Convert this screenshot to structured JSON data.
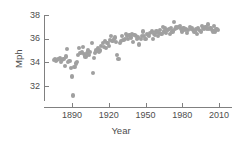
{
  "chart_data": {
    "type": "scatter",
    "title": "",
    "xlabel": "Year",
    "ylabel": "Mph",
    "xlim": [
      1872,
      2014
    ],
    "ylim": [
      30.9,
      38.4
    ],
    "grid": false,
    "legend": "none",
    "marker_color": "#a0a0a0",
    "axis_color": "#808080",
    "text_color": "#4d4d4d",
    "xticks": [
      1890,
      1920,
      1950,
      1980,
      2010
    ],
    "xtick_labels": [
      "1890",
      "1920",
      "1950",
      "1980",
      "2010"
    ],
    "yticks": [
      32,
      34,
      36,
      38
    ],
    "ytick_labels": [
      "32",
      "34",
      "36",
      "38"
    ],
    "points": [
      [
        1875,
        34.2
      ],
      [
        1876,
        34.3
      ],
      [
        1877,
        34.1
      ],
      [
        1878,
        34.2
      ],
      [
        1879,
        34.3
      ],
      [
        1880,
        34.4
      ],
      [
        1881,
        34.0
      ],
      [
        1882,
        34.2
      ],
      [
        1883,
        34.3
      ],
      [
        1884,
        33.7
      ],
      [
        1885,
        34.5
      ],
      [
        1886,
        35.1
      ],
      [
        1887,
        34.0
      ],
      [
        1888,
        34.1
      ],
      [
        1889,
        33.5
      ],
      [
        1890,
        32.8
      ],
      [
        1891,
        31.2
      ],
      [
        1892,
        33.6
      ],
      [
        1893,
        33.9
      ],
      [
        1894,
        34.0
      ],
      [
        1895,
        34.6
      ],
      [
        1896,
        35.2
      ],
      [
        1897,
        34.8
      ],
      [
        1898,
        34.9
      ],
      [
        1899,
        35.3
      ],
      [
        1900,
        34.7
      ],
      [
        1901,
        34.5
      ],
      [
        1902,
        34.8
      ],
      [
        1903,
        35.0
      ],
      [
        1904,
        34.6
      ],
      [
        1905,
        34.9
      ],
      [
        1906,
        35.6
      ],
      [
        1907,
        33.1
      ],
      [
        1908,
        34.4
      ],
      [
        1909,
        34.8
      ],
      [
        1910,
        35.0
      ],
      [
        1911,
        35.2
      ],
      [
        1912,
        34.9
      ],
      [
        1913,
        35.0
      ],
      [
        1914,
        35.4
      ],
      [
        1915,
        35.6
      ],
      [
        1916,
        35.3
      ],
      [
        1917,
        35.8
      ],
      [
        1918,
        35.2
      ],
      [
        1919,
        35.6
      ],
      [
        1920,
        35.4
      ],
      [
        1921,
        35.9
      ],
      [
        1922,
        36.2
      ],
      [
        1923,
        35.8
      ],
      [
        1924,
        36.0
      ],
      [
        1925,
        36.1
      ],
      [
        1926,
        35.7
      ],
      [
        1927,
        34.6
      ],
      [
        1928,
        34.3
      ],
      [
        1929,
        35.6
      ],
      [
        1930,
        35.8
      ],
      [
        1931,
        36.2
      ],
      [
        1932,
        35.9
      ],
      [
        1933,
        36.0
      ],
      [
        1934,
        36.4
      ],
      [
        1935,
        36.2
      ],
      [
        1936,
        36.0
      ],
      [
        1937,
        36.3
      ],
      [
        1938,
        36.1
      ],
      [
        1939,
        36.4
      ],
      [
        1940,
        35.7
      ],
      [
        1941,
        36.3
      ],
      [
        1942,
        36.2
      ],
      [
        1943,
        36.0
      ],
      [
        1944,
        36.1
      ],
      [
        1945,
        35.5
      ],
      [
        1946,
        36.0
      ],
      [
        1947,
        36.2
      ],
      [
        1948,
        36.6
      ],
      [
        1949,
        36.2
      ],
      [
        1950,
        36.0
      ],
      [
        1951,
        36.4
      ],
      [
        1952,
        36.3
      ],
      [
        1953,
        36.2
      ],
      [
        1954,
        36.5
      ],
      [
        1955,
        36.6
      ],
      [
        1956,
        36.0
      ],
      [
        1957,
        36.4
      ],
      [
        1958,
        36.3
      ],
      [
        1959,
        36.6
      ],
      [
        1960,
        36.2
      ],
      [
        1961,
        36.5
      ],
      [
        1962,
        36.7
      ],
      [
        1963,
        36.4
      ],
      [
        1964,
        37.0
      ],
      [
        1965,
        36.6
      ],
      [
        1966,
        36.9
      ],
      [
        1967,
        36.5
      ],
      [
        1968,
        36.7
      ],
      [
        1969,
        36.8
      ],
      [
        1970,
        36.4
      ],
      [
        1971,
        36.9
      ],
      [
        1972,
        36.6
      ],
      [
        1973,
        37.4
      ],
      [
        1974,
        36.8
      ],
      [
        1975,
        37.0
      ],
      [
        1976,
        36.9
      ],
      [
        1977,
        37.0
      ],
      [
        1978,
        37.1
      ],
      [
        1979,
        36.8
      ],
      [
        1980,
        36.6
      ],
      [
        1981,
        36.9
      ],
      [
        1982,
        36.7
      ],
      [
        1983,
        36.8
      ],
      [
        1984,
        36.5
      ],
      [
        1985,
        36.7
      ],
      [
        1986,
        37.0
      ],
      [
        1987,
        36.8
      ],
      [
        1988,
        36.9
      ],
      [
        1989,
        36.7
      ],
      [
        1990,
        36.6
      ],
      [
        1991,
        36.8
      ],
      [
        1992,
        36.4
      ],
      [
        1993,
        36.9
      ],
      [
        1994,
        36.7
      ],
      [
        1995,
        36.6
      ],
      [
        1996,
        37.1
      ],
      [
        1997,
        36.9
      ],
      [
        1998,
        36.8
      ],
      [
        1999,
        37.0
      ],
      [
        2000,
        36.8
      ],
      [
        2001,
        37.2
      ],
      [
        2002,
        36.8
      ],
      [
        2003,
        36.9
      ],
      [
        2004,
        36.7
      ],
      [
        2005,
        36.6
      ],
      [
        2006,
        37.1
      ],
      [
        2007,
        36.6
      ],
      [
        2008,
        36.8
      ],
      [
        2009,
        36.7
      ]
    ]
  }
}
